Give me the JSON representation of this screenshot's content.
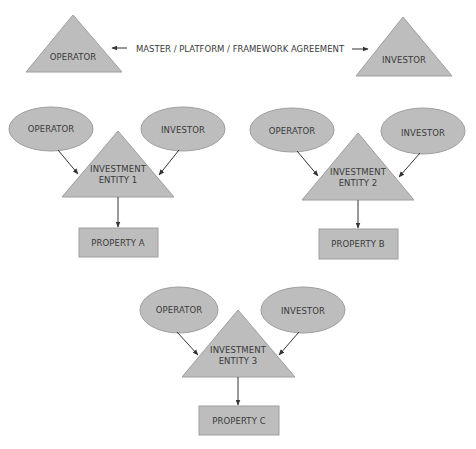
{
  "top": {
    "left_party": "OPERATOR",
    "right_party": "INVESTOR",
    "agreement_label": "MASTER / PLATFORM / FRAMEWORK AGREEMENT"
  },
  "structures": [
    {
      "operator": "OPERATOR",
      "investor": "INVESTOR",
      "entity_line1": "INVESTMENT",
      "entity_line2": "ENTITY 1",
      "property": "PROPERTY A"
    },
    {
      "operator": "OPERATOR",
      "investor": "INVESTOR",
      "entity_line1": "INVESTMENT",
      "entity_line2": "ENTITY 2",
      "property": "PROPERTY B"
    },
    {
      "operator": "OPERATOR",
      "investor": "INVESTOR",
      "entity_line1": "INVESTMENT",
      "entity_line2": "ENTITY 3",
      "property": "PROPERTY C"
    }
  ],
  "colors": {
    "shape_fill": "#bdbdbd",
    "shape_stroke": "#9e9e9e",
    "arrow": "#333333",
    "text": "#3a3a3a"
  }
}
